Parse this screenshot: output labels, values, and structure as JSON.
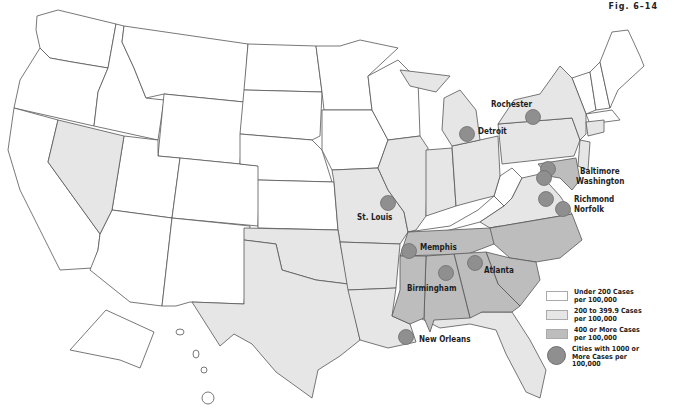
{
  "figure": {
    "label": "Fig. 6–14"
  },
  "colors": {
    "under_200": "#ffffff",
    "200_to_399": "#e6e6e6",
    "400_plus": "#bdbdbd",
    "city_marker": "#8f8f8f",
    "border": "#555555"
  },
  "legend": {
    "items": [
      {
        "label": "Under 200 Cases per 100,000",
        "type": "swatch",
        "color": "#ffffff"
      },
      {
        "label": "200 to 399.9 Cases per 100,000",
        "type": "swatch",
        "color": "#e6e6e6"
      },
      {
        "label": "400 or More Cases per 100,000",
        "type": "swatch",
        "color": "#bdbdbd"
      },
      {
        "label": "Cities with 1000 or More Cases per 100,000",
        "type": "dot",
        "color": "#8f8f8f"
      }
    ]
  },
  "cities": [
    {
      "name": "Rochester"
    },
    {
      "name": "Detroit"
    },
    {
      "name": "Baltimore"
    },
    {
      "name": "Washington"
    },
    {
      "name": "Richmond"
    },
    {
      "name": "Norfolk"
    },
    {
      "name": "St. Louis"
    },
    {
      "name": "Memphis"
    },
    {
      "name": "Atlanta"
    },
    {
      "name": "Birmingham"
    },
    {
      "name": "New Orleans"
    }
  ]
}
